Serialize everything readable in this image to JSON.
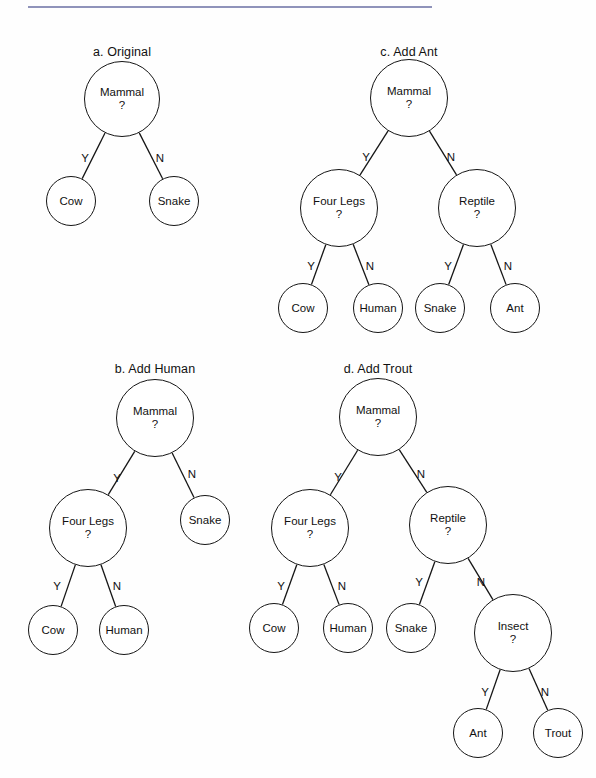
{
  "figure": {
    "background": "#fefefe",
    "stroke_color": "#151515",
    "rule_color": "#8f93ba",
    "edge_labels": {
      "yes": "Y",
      "no": "N"
    },
    "question_mark": "?"
  },
  "panels": [
    {
      "id": "panel-a",
      "title": "a. Original",
      "title_x": 122,
      "title_y": 45,
      "nodes": [
        {
          "id": "a-mammal",
          "label": "Mammal",
          "question": "?",
          "type": "internal",
          "cx": 122,
          "cy": 99,
          "d": 76
        },
        {
          "id": "a-cow",
          "label": "Cow",
          "type": "leaf",
          "cx": 71,
          "cy": 201,
          "d": 50
        },
        {
          "id": "a-snake",
          "label": "Snake",
          "type": "leaf",
          "cx": 174,
          "cy": 201,
          "d": 50
        }
      ],
      "edges": [
        {
          "from": "a-mammal",
          "to": "a-cow",
          "label": "Y",
          "lx": 85,
          "ly": 158
        },
        {
          "from": "a-mammal",
          "to": "a-snake",
          "label": "N",
          "lx": 160,
          "ly": 158
        }
      ]
    },
    {
      "id": "panel-c",
      "title": "c. Add Ant",
      "title_x": 409,
      "title_y": 45,
      "nodes": [
        {
          "id": "c-mammal",
          "label": "Mammal",
          "question": "?",
          "type": "internal",
          "cx": 409,
          "cy": 98,
          "d": 78
        },
        {
          "id": "c-fourlegs",
          "label": "Four Legs",
          "question": "?",
          "type": "internal",
          "cx": 339,
          "cy": 208,
          "d": 78
        },
        {
          "id": "c-reptile",
          "label": "Reptile",
          "question": "?",
          "type": "internal",
          "cx": 477,
          "cy": 208,
          "d": 78
        },
        {
          "id": "c-cow",
          "label": "Cow",
          "type": "leaf",
          "cx": 303,
          "cy": 308,
          "d": 50
        },
        {
          "id": "c-human",
          "label": "Human",
          "type": "leaf",
          "cx": 378,
          "cy": 308,
          "d": 50
        },
        {
          "id": "c-snake",
          "label": "Snake",
          "type": "leaf",
          "cx": 440,
          "cy": 308,
          "d": 50
        },
        {
          "id": "c-ant",
          "label": "Ant",
          "type": "leaf",
          "cx": 515,
          "cy": 308,
          "d": 50
        }
      ],
      "edges": [
        {
          "from": "c-mammal",
          "to": "c-fourlegs",
          "label": "Y",
          "lx": 366,
          "ly": 157
        },
        {
          "from": "c-mammal",
          "to": "c-reptile",
          "label": "N",
          "lx": 451,
          "ly": 157
        },
        {
          "from": "c-fourlegs",
          "to": "c-cow",
          "label": "Y",
          "lx": 311,
          "ly": 266
        },
        {
          "from": "c-fourlegs",
          "to": "c-human",
          "label": "N",
          "lx": 370,
          "ly": 266
        },
        {
          "from": "c-reptile",
          "to": "c-snake",
          "label": "Y",
          "lx": 448,
          "ly": 266
        },
        {
          "from": "c-reptile",
          "to": "c-ant",
          "label": "N",
          "lx": 508,
          "ly": 266
        }
      ]
    },
    {
      "id": "panel-b",
      "title": "b. Add Human",
      "title_x": 155,
      "title_y": 362,
      "nodes": [
        {
          "id": "b-mammal",
          "label": "Mammal",
          "question": "?",
          "type": "internal",
          "cx": 155,
          "cy": 418,
          "d": 78
        },
        {
          "id": "b-fourlegs",
          "label": "Four Legs",
          "question": "?",
          "type": "internal",
          "cx": 88,
          "cy": 528,
          "d": 78
        },
        {
          "id": "b-snake",
          "label": "Snake",
          "type": "leaf",
          "cx": 205,
          "cy": 520,
          "d": 50
        },
        {
          "id": "b-cow",
          "label": "Cow",
          "type": "leaf",
          "cx": 53,
          "cy": 630,
          "d": 50
        },
        {
          "id": "b-human",
          "label": "Human",
          "type": "leaf",
          "cx": 124,
          "cy": 630,
          "d": 50
        }
      ],
      "edges": [
        {
          "from": "b-mammal",
          "to": "b-fourlegs",
          "label": "Y",
          "lx": 117,
          "ly": 478
        },
        {
          "from": "b-mammal",
          "to": "b-snake",
          "label": "N",
          "lx": 192,
          "ly": 474
        },
        {
          "from": "b-fourlegs",
          "to": "b-cow",
          "label": "Y",
          "lx": 57,
          "ly": 586
        },
        {
          "from": "b-fourlegs",
          "to": "b-human",
          "label": "N",
          "lx": 117,
          "ly": 586
        }
      ]
    },
    {
      "id": "panel-d",
      "title": "d. Add Trout",
      "title_x": 378,
      "title_y": 362,
      "nodes": [
        {
          "id": "d-mammal",
          "label": "Mammal",
          "question": "?",
          "type": "internal",
          "cx": 378,
          "cy": 417,
          "d": 78
        },
        {
          "id": "d-fourlegs",
          "label": "Four Legs",
          "question": "?",
          "type": "internal",
          "cx": 310,
          "cy": 528,
          "d": 78
        },
        {
          "id": "d-reptile",
          "label": "Reptile",
          "question": "?",
          "type": "internal",
          "cx": 448,
          "cy": 525,
          "d": 78
        },
        {
          "id": "d-cow",
          "label": "Cow",
          "type": "leaf",
          "cx": 274,
          "cy": 628,
          "d": 50
        },
        {
          "id": "d-human",
          "label": "Human",
          "type": "leaf",
          "cx": 348,
          "cy": 628,
          "d": 50
        },
        {
          "id": "d-snake",
          "label": "Snake",
          "type": "leaf",
          "cx": 411,
          "cy": 628,
          "d": 50
        },
        {
          "id": "d-insect",
          "label": "Insect",
          "question": "?",
          "type": "internal",
          "cx": 513,
          "cy": 633,
          "d": 78
        },
        {
          "id": "d-ant",
          "label": "Ant",
          "type": "leaf",
          "cx": 478,
          "cy": 733,
          "d": 50
        },
        {
          "id": "d-trout",
          "label": "Trout",
          "type": "leaf",
          "cx": 558,
          "cy": 733,
          "d": 50
        }
      ],
      "edges": [
        {
          "from": "d-mammal",
          "to": "d-fourlegs",
          "label": "Y",
          "lx": 338,
          "ly": 477
        },
        {
          "from": "d-mammal",
          "to": "d-reptile",
          "label": "N",
          "lx": 421,
          "ly": 474
        },
        {
          "from": "d-fourlegs",
          "to": "d-cow",
          "label": "Y",
          "lx": 281,
          "ly": 586
        },
        {
          "from": "d-fourlegs",
          "to": "d-human",
          "label": "N",
          "lx": 342,
          "ly": 586
        },
        {
          "from": "d-reptile",
          "to": "d-snake",
          "label": "Y",
          "lx": 419,
          "ly": 582
        },
        {
          "from": "d-reptile",
          "to": "d-insect",
          "label": "N",
          "lx": 481,
          "ly": 582
        },
        {
          "from": "d-insect",
          "to": "d-ant",
          "label": "Y",
          "lx": 485,
          "ly": 692
        },
        {
          "from": "d-insect",
          "to": "d-trout",
          "label": "N",
          "lx": 545,
          "ly": 692
        }
      ]
    }
  ]
}
